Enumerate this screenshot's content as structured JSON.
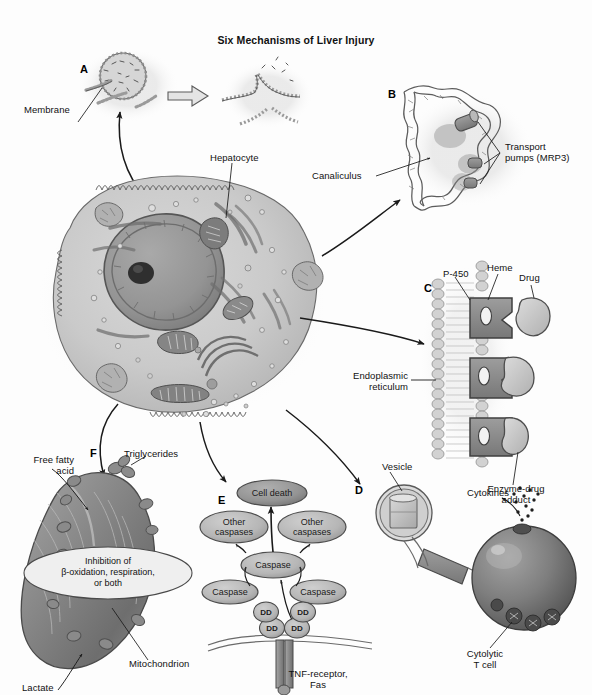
{
  "figure": {
    "title": "Six Mechanisms of Liver Injury",
    "panels": [
      {
        "letter": "A",
        "topic": "Membrane disruption"
      },
      {
        "letter": "B",
        "topic": "Transport pump inhibition"
      },
      {
        "letter": "C",
        "topic": "Enzyme-drug adduct formation"
      },
      {
        "letter": "D",
        "topic": "Vesicle / immune presentation"
      },
      {
        "letter": "E",
        "topic": "Caspase apoptosis cascade"
      },
      {
        "letter": "F",
        "topic": "Mitochondrial inhibition"
      }
    ],
    "panel_letters": {
      "a": "A",
      "b": "B",
      "c": "C",
      "d": "D",
      "e": "E",
      "f": "F"
    },
    "labels": {
      "membrane": "Membrane",
      "hepatocyte": "Hepatocyte",
      "canaliculus": "Canaliculus",
      "transport_pumps": "Transport\npumps (MRP3)",
      "p450": "P-450",
      "heme": "Heme",
      "drug": "Drug",
      "endoplasmic_reticulum": "Endoplasmic\nreticulum",
      "enzyme_drug_adduct": "Enzyme-drug\nadduct",
      "vesicle": "Vesicle",
      "cytokines": "Cytokines",
      "cytolytic_t_cell": "Cytolytic\nT cell",
      "free_fatty_acid": "Free fatty\nacid",
      "triglycerides": "Triglycerides",
      "mitochondrion": "Mitochondrion",
      "lactate": "Lactate",
      "tnf_receptor": "TNF-receptor,\nFas"
    },
    "balloon": {
      "inhibition": "Inhibition of\nβ-oxidation, respiration,\nor both"
    },
    "cascade": {
      "cell_death": "Cell death",
      "other_caspases_left": "Other\ncaspases",
      "other_caspases_right": "Other\ncaspases",
      "caspase_center": "Caspase",
      "caspase_left": "Caspase",
      "caspase_right": "Caspase",
      "dd_1": "DD",
      "dd_2": "DD",
      "dd_3": "DD",
      "dd_4": "DD"
    },
    "colors": {
      "background": "#fdfdfd",
      "line": "#1a1a1a",
      "cytoplasm": "#c9c9c9",
      "nucleus": "#9a9a9a",
      "nucleolus": "#2d2d2d",
      "organelle": "#7d7d7d",
      "node_fill": "#b8b8b8",
      "node_dark": "#8f8f8f",
      "mitochondrion": "#8c8c8c",
      "tcell": "#7a7a7a",
      "membrane_lipid": "#bdbdbd",
      "enzyme": "#8a8a8a"
    }
  }
}
